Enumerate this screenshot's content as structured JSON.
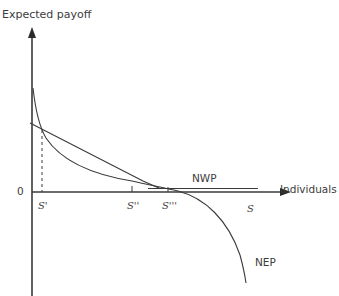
{
  "diagram": {
    "y_axis_label": "Expected payoff",
    "x_axis_label": "Individuals",
    "origin_label": "0",
    "x_ticks": [
      {
        "id": "s1",
        "label": "S'"
      },
      {
        "id": "s2",
        "label": "S''"
      },
      {
        "id": "s3",
        "label": "S'''"
      },
      {
        "id": "s4",
        "label": "S"
      }
    ],
    "curves": {
      "nwp": {
        "label": "NWP"
      },
      "nep": {
        "label": "NEP"
      }
    },
    "colors": {
      "line": "#3a3a3a",
      "background": "#ffffff"
    }
  }
}
